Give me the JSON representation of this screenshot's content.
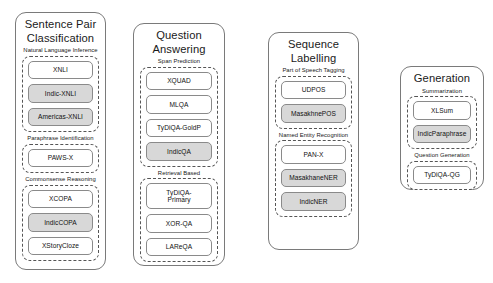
{
  "figure": {
    "background_color": "#ffffff",
    "panel_border_color": "#7a7a7a",
    "group_border_color": "#555555",
    "chip_border_color": "#8a8a8a",
    "chip_highlight_color": "#d8d8d8"
  },
  "columns": [
    {
      "title": "Sentence Pair\nClassification",
      "groups": [
        {
          "label": "Natural Language Inference",
          "chips": [
            {
              "label": "XNLI",
              "highlighted": false
            },
            {
              "label": "Indic-XNLI",
              "highlighted": true
            },
            {
              "label": "Americas-XNLI",
              "highlighted": true
            }
          ]
        },
        {
          "label": "Paraphrase Identification",
          "chips": [
            {
              "label": "PAWS-X",
              "highlighted": false
            }
          ]
        },
        {
          "label": "Commonsense Reasoning",
          "chips": [
            {
              "label": "XCOPA",
              "highlighted": false
            },
            {
              "label": "IndicCOPA",
              "highlighted": true
            },
            {
              "label": "XStoryCloze",
              "highlighted": false
            }
          ]
        }
      ]
    },
    {
      "title": "Question\nAnswering",
      "groups": [
        {
          "label": "Span Prediction",
          "chips": [
            {
              "label": "XQUAD",
              "highlighted": false
            },
            {
              "label": "MLQA",
              "highlighted": false
            },
            {
              "label": "TyDiQA-GoldP",
              "highlighted": false
            },
            {
              "label": "IndicQA",
              "highlighted": true
            }
          ]
        },
        {
          "label": "Retrieval Based",
          "chips": [
            {
              "label": "TyDiQA-\nPrimary",
              "highlighted": false
            },
            {
              "label": "XOR-QA",
              "highlighted": false
            },
            {
              "label": "LAReQA",
              "highlighted": false
            }
          ]
        }
      ]
    },
    {
      "title": "Sequence\nLabelling",
      "groups": [
        {
          "label": "Part of Speech Tagging",
          "chips": [
            {
              "label": "UDPOS",
              "highlighted": false
            },
            {
              "label": "MasakhnePOS",
              "highlighted": true
            }
          ]
        },
        {
          "label": "Named Entity Recognition",
          "chips": [
            {
              "label": "PAN-X",
              "highlighted": false
            },
            {
              "label": "MasakhaneNER",
              "highlighted": true
            },
            {
              "label": "IndicNER",
              "highlighted": true
            }
          ]
        }
      ]
    },
    {
      "title": "Generation",
      "groups": [
        {
          "label": "Summarization",
          "chips": [
            {
              "label": "XLSum",
              "highlighted": false
            },
            {
              "label": "IndicParaphrase",
              "highlighted": true
            }
          ]
        },
        {
          "label": "Question Generation",
          "chips": [
            {
              "label": "TyDiQA-QG",
              "highlighted": false
            }
          ]
        }
      ]
    }
  ]
}
